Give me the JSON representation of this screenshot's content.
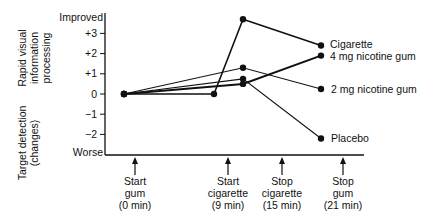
{
  "chart_data": {
    "type": "line",
    "title": "",
    "ylabel_lines": [
      "Rapid visual",
      "information",
      "processing"
    ],
    "ylabel2_lines": [
      "Target detection",
      "(changes)"
    ],
    "y_ticks": [
      {
        "label": "Improved",
        "value": 3.8
      },
      {
        "label": "+3",
        "value": 3
      },
      {
        "label": "+2",
        "value": 2
      },
      {
        "label": "+1",
        "value": 1
      },
      {
        "label": "0",
        "value": 0
      },
      {
        "label": "−1",
        "value": -1
      },
      {
        "label": "−2",
        "value": -2
      },
      {
        "label": "Worse",
        "value": -2.9
      }
    ],
    "ylim": [
      -3,
      4
    ],
    "x_events": [
      {
        "lines": [
          "Start",
          "gum",
          "(0 min)"
        ],
        "x": 0
      },
      {
        "lines": [
          "Start",
          "cigarette",
          "(9 min)"
        ],
        "x": 9
      },
      {
        "lines": [
          "Stop",
          "cigarette",
          "(15 min)"
        ],
        "x": 15
      },
      {
        "lines": [
          "Stop",
          "gum",
          "(21 min)"
        ],
        "x": 21
      }
    ],
    "x_point_positions": [
      0,
      9,
      11,
      16.5
    ],
    "series": [
      {
        "name": "Cigarette",
        "points": [
          [
            0,
            0
          ],
          [
            9,
            0
          ],
          [
            11,
            3.7
          ],
          [
            16.5,
            2.4
          ]
        ]
      },
      {
        "name": "4 mg nicotine gum",
        "points": [
          [
            0,
            0
          ],
          [
            11,
            0.5
          ],
          [
            16.5,
            1.9
          ]
        ]
      },
      {
        "name": "2 mg nicotine gum",
        "points": [
          [
            0,
            0
          ],
          [
            11,
            1.3
          ],
          [
            16.5,
            0.25
          ]
        ]
      },
      {
        "name": "Placebo",
        "points": [
          [
            0,
            0
          ],
          [
            11,
            0.75
          ],
          [
            16.5,
            -2.2
          ]
        ]
      }
    ],
    "legend_position": "inline-right",
    "grid": false
  }
}
